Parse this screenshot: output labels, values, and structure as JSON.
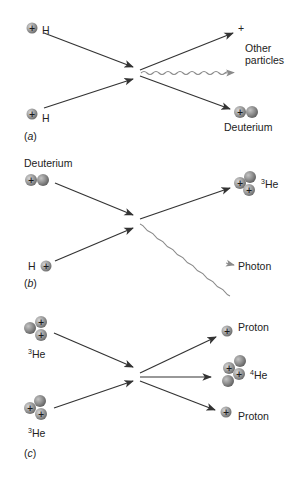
{
  "figure": {
    "colors": {
      "arrow": "#333333",
      "photon": "#8a8a8a",
      "proton_fill": "#9a9a9a",
      "neutron_fill": "#8c8c8c",
      "text": "#222222"
    },
    "panels": [
      {
        "id": "a",
        "label": "(a)",
        "inputs": [
          {
            "particle": "proton",
            "label": "H"
          },
          {
            "particle": "proton",
            "label": "H"
          }
        ],
        "outputs": [
          {
            "particle": "positron",
            "label": "+"
          },
          {
            "particle": "other",
            "label_line1": "Other",
            "label_line2": "particles"
          },
          {
            "particle": "deuterium",
            "label": "Deuterium"
          }
        ]
      },
      {
        "id": "b",
        "label": "(b)",
        "inputs": [
          {
            "particle": "deuterium",
            "label": "Deuterium"
          },
          {
            "particle": "proton",
            "label": "H"
          }
        ],
        "outputs": [
          {
            "particle": "helium-3",
            "label_sup": "3",
            "label": "He"
          },
          {
            "particle": "photon",
            "label": "Photon"
          }
        ]
      },
      {
        "id": "c",
        "label": "(c)",
        "inputs": [
          {
            "particle": "helium-3",
            "label_sup": "3",
            "label": "He"
          },
          {
            "particle": "helium-3",
            "label_sup": "3",
            "label": "He"
          }
        ],
        "outputs": [
          {
            "particle": "proton",
            "label": "Proton"
          },
          {
            "particle": "helium-4",
            "label_sup": "4",
            "label": "He"
          },
          {
            "particle": "proton",
            "label": "Proton"
          }
        ]
      }
    ],
    "plus_sign": "+"
  }
}
